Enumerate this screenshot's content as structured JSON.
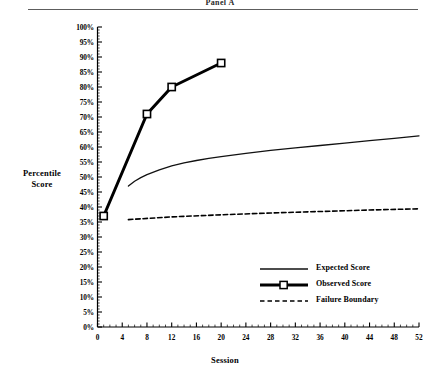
{
  "figure": {
    "title": "Panel A",
    "y_axis_title_line1": "Percentile",
    "y_axis_title_line2": "Score",
    "x_axis_title": "Session"
  },
  "legend": {
    "position": "inside-lower-right",
    "items": [
      {
        "label": "Expected Score",
        "key": "thin-solid-line"
      },
      {
        "label": "Observed Score",
        "key": "thick-line-with-square-marker"
      },
      {
        "label": "Failure Boundary",
        "key": "dashed-line"
      }
    ]
  },
  "chart_data": {
    "type": "line",
    "title": "Panel A",
    "xlabel": "Session",
    "ylabel": "Percentile Score",
    "xlim": [
      0,
      52
    ],
    "ylim": [
      0,
      100
    ],
    "xticks": [
      0,
      4,
      8,
      12,
      16,
      20,
      24,
      28,
      32,
      36,
      40,
      44,
      48,
      52
    ],
    "xtick_labels": [
      "0",
      "4",
      "8",
      "12",
      "16",
      "20",
      "24",
      "28",
      "32",
      "36",
      "40",
      "44",
      "48",
      "52"
    ],
    "yticks": [
      0,
      5,
      10,
      15,
      20,
      25,
      30,
      35,
      40,
      45,
      50,
      55,
      60,
      65,
      70,
      75,
      80,
      85,
      90,
      95,
      100
    ],
    "ytick_labels": [
      "0%",
      "5%",
      "10%",
      "15%",
      "20%",
      "25%",
      "30%",
      "35%",
      "40%",
      "45%",
      "50%",
      "55%",
      "60%",
      "65%",
      "70%",
      "75%",
      "80%",
      "85%",
      "90%",
      "95%",
      "100%"
    ],
    "minor_ticks": true,
    "grid": false,
    "series": [
      {
        "name": "Expected Score",
        "style": "solid",
        "linewidth": 1.3,
        "marker": "none",
        "color": "#111111",
        "x": [
          5,
          6,
          7,
          8,
          10,
          12,
          14,
          16,
          18,
          20,
          24,
          28,
          32,
          36,
          40,
          44,
          48,
          52
        ],
        "y": [
          47.0,
          48.6,
          49.8,
          50.8,
          52.4,
          53.7,
          54.7,
          55.5,
          56.2,
          56.8,
          57.9,
          58.9,
          59.7,
          60.5,
          61.3,
          62.1,
          62.9,
          63.7
        ]
      },
      {
        "name": "Observed Score",
        "style": "solid",
        "linewidth": 3.0,
        "marker": "square-open",
        "color": "#000000",
        "x": [
          1,
          8,
          12,
          20
        ],
        "y": [
          37.0,
          71.0,
          80.0,
          88.0
        ]
      },
      {
        "name": "Failure Boundary",
        "style": "dashed",
        "linewidth": 1.6,
        "marker": "none",
        "color": "#000000",
        "x": [
          5,
          12,
          20,
          28,
          36,
          44,
          52
        ],
        "y": [
          35.8,
          36.7,
          37.4,
          38.0,
          38.5,
          39.0,
          39.4
        ]
      }
    ]
  }
}
